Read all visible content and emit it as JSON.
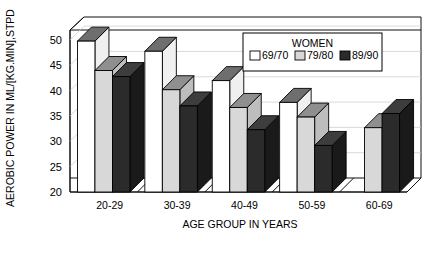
{
  "chart_data": {
    "type": "bar",
    "title": "",
    "xlabel": "AGE GROUP IN YEARS",
    "ylabel": "AEROBIC POWER IN ML/[KG.MIN],STPD",
    "categories": [
      "20-29",
      "30-39",
      "40-49",
      "50-59",
      "60-69"
    ],
    "ylim": [
      20,
      52
    ],
    "yticks": [
      20,
      25,
      30,
      35,
      40,
      45,
      50
    ],
    "ytick_labels": [
      "20",
      "25",
      "30",
      "35",
      "40",
      "45",
      "50"
    ],
    "grid": true,
    "legend_position": "top-right",
    "legend_title": "WOMEN",
    "series": [
      {
        "name": "69/70",
        "color": "#ffffff",
        "values": [
          49.8,
          47.8,
          42.0,
          37.7,
          null
        ]
      },
      {
        "name": "79/80",
        "color": "#d8d8d8",
        "values": [
          44.0,
          40.2,
          36.7,
          34.8,
          32.7
        ]
      },
      {
        "name": "89/90",
        "color": "#2b2b2b",
        "values": [
          42.8,
          37.0,
          32.3,
          29.2,
          35.5
        ]
      }
    ]
  },
  "axis": {
    "y_title": "AEROBIC POWER IN ML/[KG.MIN],STPD",
    "x_title": "AGE GROUP IN YEARS",
    "ticks": [
      "50",
      "45",
      "40",
      "35",
      "30",
      "25",
      "20"
    ],
    "categories": [
      "20-29",
      "30-39",
      "40-49",
      "50-59",
      "60-69"
    ]
  },
  "legend": {
    "title": "WOMEN",
    "entries": [
      {
        "label": "69/70",
        "color": "#ffffff"
      },
      {
        "label": "79/80",
        "color": "#d8d8d8"
      },
      {
        "label": "89/90",
        "color": "#2b2b2b"
      }
    ]
  },
  "colors": {
    "series_1": "#ffffff",
    "series_2": "#d8d8d8",
    "series_3": "#2b2b2b",
    "outline": "#000000",
    "grid": "#c9c9c9",
    "background": "#ffffff"
  }
}
